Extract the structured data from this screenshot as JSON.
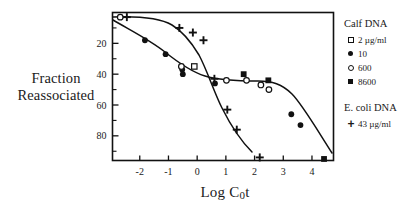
{
  "chart_data": {
    "type": "scatter",
    "title": "",
    "xlabel": "Log C0t",
    "xlabel_parts": {
      "pre": "Log C",
      "sub": "0",
      "post": "t"
    },
    "ylabel": "Fraction Reassociated",
    "ylabel_line1": "Fraction",
    "ylabel_line2": "Reassociated",
    "xlim": [
      -2.95,
      4.75
    ],
    "ylim": [
      96,
      0
    ],
    "y_inverted": true,
    "grid": false,
    "xticks": [
      -2,
      -1,
      0,
      1,
      2,
      3,
      4
    ],
    "xticklabels": [
      "-2",
      "-1",
      "0",
      "1",
      "2",
      "3",
      "4"
    ],
    "yticks": [
      20,
      40,
      60,
      80
    ],
    "yticklabels": [
      "20",
      "40",
      "60",
      "80"
    ],
    "y_minor_ticks": [
      10,
      30,
      50,
      70,
      90
    ],
    "legend_position": "right-outside",
    "series": [
      {
        "name": "Calf DNA 2 ug/ml",
        "marker": "open-square",
        "points": [
          [
            -0.1,
            35
          ]
        ]
      },
      {
        "name": "Calf DNA 10 ug/ml",
        "marker": "filled-circle",
        "points": [
          [
            -1.82,
            18
          ],
          [
            -1.1,
            27
          ],
          [
            -0.52,
            37
          ],
          [
            -0.5,
            40
          ],
          [
            0.62,
            46
          ],
          [
            3.28,
            66
          ],
          [
            3.6,
            73
          ]
        ]
      },
      {
        "name": "Calf DNA 600 ug/ml",
        "marker": "open-circle",
        "points": [
          [
            -2.68,
            3
          ],
          [
            -0.55,
            35
          ],
          [
            1.02,
            44
          ],
          [
            1.72,
            44
          ],
          [
            2.22,
            47
          ],
          [
            2.5,
            50
          ]
        ]
      },
      {
        "name": "Calf DNA 8600 ug/ml",
        "marker": "filled-square",
        "points": [
          [
            1.62,
            40
          ],
          [
            2.48,
            44
          ],
          [
            4.42,
            95
          ]
        ]
      },
      {
        "name": "E. coli DNA 43 ug/ml",
        "marker": "plus",
        "points": [
          [
            -2.45,
            3
          ],
          [
            -0.62,
            10
          ],
          [
            -0.15,
            13
          ],
          [
            0.22,
            18
          ],
          [
            0.6,
            43
          ],
          [
            1.05,
            63
          ],
          [
            1.38,
            76
          ],
          [
            2.18,
            94
          ]
        ]
      }
    ],
    "curves": [
      {
        "name": "calf-dna-curve",
        "path": "M 113,20 C 130,30 150,40 165,52 C 180,64 192,72 205,76 C 218,80 240,81 258,81 C 272,81 282,84 292,94 C 302,104 316,128 332,153"
      },
      {
        "name": "ecoli-dna-curve",
        "path": "M 113,17 C 140,16 160,18 172,25 C 182,31 190,40 199,55 C 207,70 214,92 222,108 C 230,124 240,140 252,152"
      }
    ]
  },
  "legend": {
    "groups": [
      {
        "title": "Calf DNA",
        "entries": [
          {
            "marker": "open-square",
            "label": "2 µg/ml"
          },
          {
            "marker": "filled-circle",
            "label": "10"
          },
          {
            "marker": "open-circle",
            "label": "600"
          },
          {
            "marker": "filled-square",
            "label": "8600"
          }
        ]
      },
      {
        "title": "E. coli DNA",
        "entries": [
          {
            "marker": "plus",
            "label": "43 µg/ml"
          }
        ]
      }
    ]
  },
  "colors": {
    "ink": "#111111",
    "background": "#ffffff"
  }
}
